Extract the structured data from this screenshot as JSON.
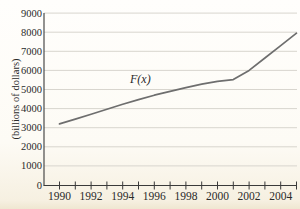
{
  "title_partial": "U.S. National Debt",
  "curve_label": "F(x)",
  "y_axis": {
    "label": "(billions of dollars)",
    "tick_values": [
      0,
      1000,
      2000,
      3000,
      4000,
      5000,
      6000,
      7000,
      8000,
      9000
    ]
  },
  "x_axis": {
    "labeled_years": [
      "1990",
      "1992",
      "1994",
      "1996",
      "1998",
      "2000",
      "2002",
      "2004"
    ],
    "minor_tick_years": [
      1990,
      1991,
      1992,
      1993,
      1994,
      1995,
      1996,
      1997,
      1998,
      1999,
      2000,
      2001,
      2002,
      2003,
      2004,
      2005
    ]
  },
  "chart_data": {
    "type": "line",
    "xlabel": "",
    "ylabel": "(billions of dollars)",
    "legend_position": "none",
    "grid": "horizontal",
    "xlim": [
      1989,
      2005.3
    ],
    "ylim": [
      0,
      9000
    ],
    "x_tick_interval_labeled": 2,
    "x_tick_interval_minor": 1,
    "series": [
      {
        "name": "F(x)",
        "x": [
          1990,
          1991,
          1992,
          1993,
          1994,
          1995,
          1996,
          1997,
          1998,
          1999,
          2000,
          2001,
          2002,
          2003,
          2004,
          2005
        ],
        "values": [
          3200,
          3450,
          3700,
          3970,
          4230,
          4470,
          4700,
          4900,
          5100,
          5280,
          5430,
          5520,
          6000,
          6650,
          7300,
          7950
        ]
      }
    ]
  },
  "colors": {
    "curve": "#6e6e6e",
    "axis": "#3a3a3a",
    "grid": "#d8d5ce",
    "text": "#2a2a2a",
    "background": "#fdfbf4"
  }
}
